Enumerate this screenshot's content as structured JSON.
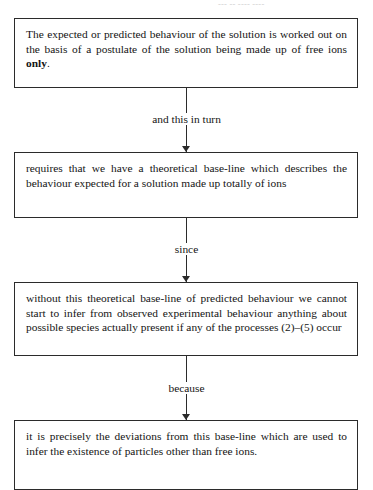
{
  "page": {
    "bleed_text": "— — --- -- ---- ----",
    "ink_color": "#2b2b2b",
    "text_color": "#141414",
    "background": "#ffffff"
  },
  "diagram": {
    "type": "vertical-flowchart",
    "title": "",
    "nodes": [
      {
        "id": "node-1",
        "text_before_bold": "The expected or predicted behaviour of the solution is worked out on the basis of a postulate of the solution being made up of free ions ",
        "bold_text": "only",
        "text_after_bold": ".",
        "full_text": "The expected or predicted behaviour of the solution is worked out on the basis of a postulate of the solution being made up of free ions only."
      },
      {
        "id": "node-2",
        "text": "requires that we have a theoretical base-line which describes the behaviour expected for a solution made up totally of ions"
      },
      {
        "id": "node-3",
        "text": "without this theoretical base-line of predicted behaviour we cannot start to infer from observed experimental behaviour anything about possible species actually present if any of the processes (2)–(5) occur"
      },
      {
        "id": "node-4",
        "text": "it is precisely the deviations from this base-line which are used to infer the existence of particles other than free ions."
      }
    ],
    "connectors": [
      {
        "id": "connector-1",
        "label": "and this in turn",
        "from": "node-1",
        "to": "node-2"
      },
      {
        "id": "connector-2",
        "label": "since",
        "from": "node-2",
        "to": "node-3"
      },
      {
        "id": "connector-3",
        "label": "because",
        "from": "node-3",
        "to": "node-4"
      }
    ]
  }
}
